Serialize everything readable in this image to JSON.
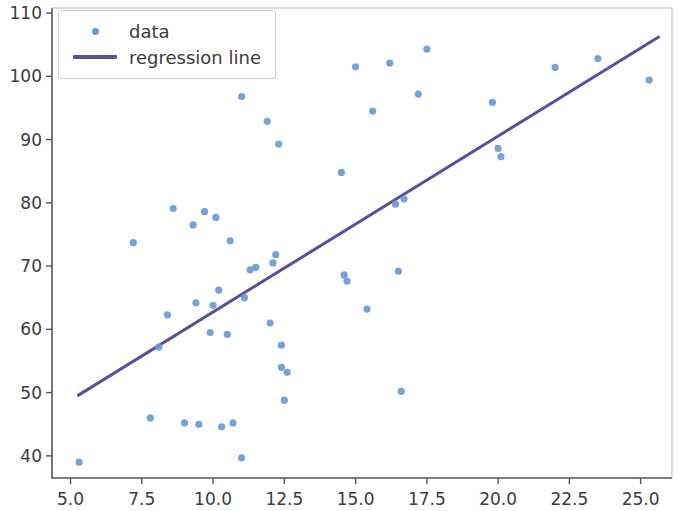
{
  "figure": {
    "width": 679,
    "height": 511,
    "background": "#ffffff"
  },
  "axes": {
    "left_px": 52,
    "right_px": 672,
    "top_px": 8,
    "bottom_px": 478,
    "spine_color": "#555555",
    "tick_color": "#555555",
    "label_color": "#3b3b3b"
  },
  "legend": {
    "entries": [
      {
        "label": "data",
        "marker": "dot",
        "color": "#6a9ad6"
      },
      {
        "label": "regression line",
        "marker": "line",
        "color": "#5a4f9e"
      }
    ],
    "frame_color": "#d0d0d0",
    "position": "upper left"
  },
  "chart_data": {
    "type": "scatter",
    "title": "",
    "xlabel": "",
    "ylabel": "",
    "xlim": [
      4.35,
      26.1
    ],
    "ylim": [
      36.5,
      110.8
    ],
    "grid": false,
    "legend_position": "upper left",
    "series": [
      {
        "name": "data",
        "type": "scatter",
        "color": "#6a9ad6",
        "marker_size": 5,
        "points": [
          [
            5.3,
            39.0
          ],
          [
            7.2,
            73.7
          ],
          [
            7.8,
            46.0
          ],
          [
            8.1,
            57.2
          ],
          [
            8.4,
            62.3
          ],
          [
            8.6,
            79.1
          ],
          [
            9.0,
            45.2
          ],
          [
            9.3,
            76.5
          ],
          [
            9.4,
            64.2
          ],
          [
            9.5,
            45.0
          ],
          [
            9.7,
            78.6
          ],
          [
            9.9,
            59.5
          ],
          [
            10.0,
            63.8
          ],
          [
            10.1,
            77.7
          ],
          [
            10.2,
            66.2
          ],
          [
            10.3,
            44.6
          ],
          [
            10.5,
            59.2
          ],
          [
            10.6,
            74.0
          ],
          [
            10.7,
            45.2
          ],
          [
            11.0,
            96.8
          ],
          [
            11.0,
            39.7
          ],
          [
            11.1,
            65.0
          ],
          [
            11.3,
            69.4
          ],
          [
            11.5,
            69.8
          ],
          [
            11.9,
            92.9
          ],
          [
            12.0,
            61.0
          ],
          [
            12.1,
            70.5
          ],
          [
            12.2,
            71.8
          ],
          [
            12.3,
            89.3
          ],
          [
            12.4,
            57.5
          ],
          [
            12.4,
            54.0
          ],
          [
            12.5,
            48.8
          ],
          [
            12.6,
            53.2
          ],
          [
            14.5,
            84.8
          ],
          [
            14.6,
            68.6
          ],
          [
            14.7,
            67.6
          ],
          [
            15.0,
            101.5
          ],
          [
            15.4,
            63.2
          ],
          [
            15.6,
            94.5
          ],
          [
            16.2,
            102.1
          ],
          [
            16.4,
            79.8
          ],
          [
            16.5,
            69.2
          ],
          [
            16.6,
            50.2
          ],
          [
            16.7,
            80.6
          ],
          [
            17.2,
            97.2
          ],
          [
            17.5,
            104.3
          ],
          [
            19.8,
            95.9
          ],
          [
            20.0,
            88.6
          ],
          [
            20.1,
            87.3
          ],
          [
            22.0,
            101.4
          ],
          [
            23.5,
            102.8
          ],
          [
            25.3,
            99.4
          ]
        ]
      },
      {
        "name": "regression line",
        "type": "line",
        "color": "#5a4f9e",
        "line_width": 3,
        "endpoints": [
          [
            5.28,
            49.6
          ],
          [
            25.63,
            106.2
          ]
        ],
        "slope": 2.78,
        "intercept": 34.9
      }
    ],
    "xticks": [
      5.0,
      7.5,
      10.0,
      12.5,
      15.0,
      17.5,
      20.0,
      22.5,
      25.0
    ],
    "xticklabels": [
      "5.0",
      "7.5",
      "10.0",
      "12.5",
      "15.0",
      "17.5",
      "20.0",
      "22.5",
      "25.0"
    ],
    "yticks": [
      40,
      50,
      60,
      70,
      80,
      90,
      100,
      110
    ],
    "yticklabels": [
      "40",
      "50",
      "60",
      "70",
      "80",
      "90",
      "100",
      "110"
    ]
  }
}
